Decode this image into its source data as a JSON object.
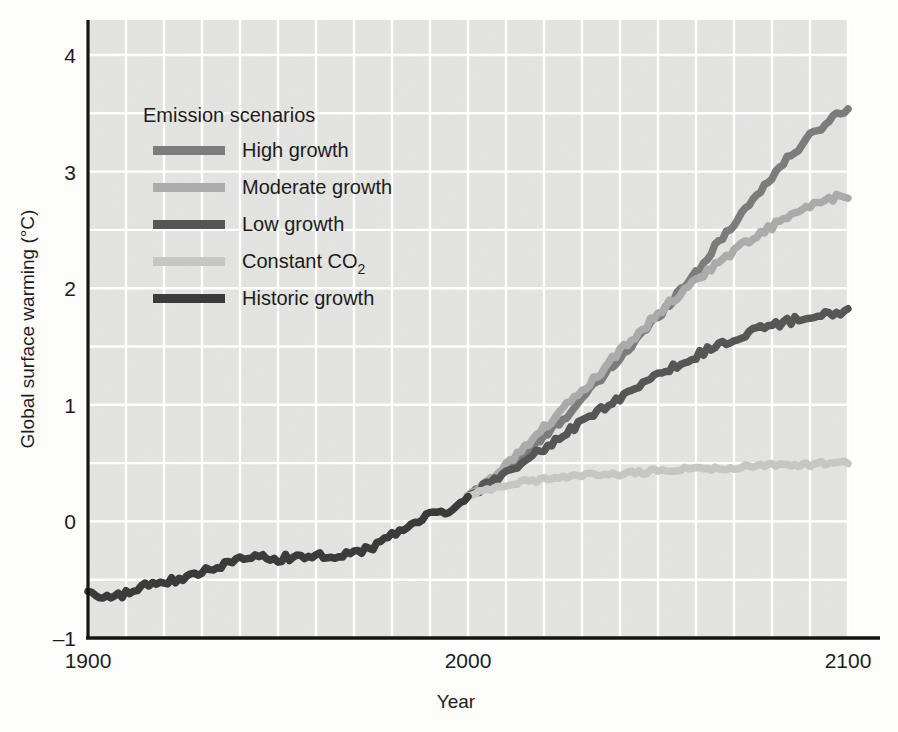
{
  "chart_data": {
    "type": "line",
    "title": "",
    "xlabel": "Year",
    "ylabel": "Global surface warming (°C)",
    "xlim": [
      1900,
      2100
    ],
    "ylim": [
      -1,
      4.3
    ],
    "xticks": [
      1900,
      2000,
      2100
    ],
    "xtick_labels": [
      "1900",
      "2000",
      "2100"
    ],
    "yticks": [
      -1,
      0,
      1,
      2,
      3,
      4
    ],
    "ytick_labels": [
      "–1",
      "0",
      "1",
      "2",
      "3",
      "4"
    ],
    "grid": true,
    "grid_color": "#ffffff",
    "grid_x_step": 10,
    "grid_y_step": 0.5,
    "plot_background": "#e8e8e6",
    "legend_position": "upper-left-inside",
    "legend_title": "Emission scenarios",
    "branch_year": 2000,
    "series": [
      {
        "name": "High growth",
        "color": "#7c7c7c",
        "start_year": 2000,
        "end_year": 2100,
        "end_value": 3.55,
        "x": [
          2000,
          2005,
          2010,
          2015,
          2020,
          2025,
          2030,
          2035,
          2040,
          2045,
          2050,
          2055,
          2060,
          2065,
          2070,
          2075,
          2080,
          2085,
          2090,
          2095,
          2100
        ],
        "values": [
          0.22,
          0.33,
          0.45,
          0.58,
          0.72,
          0.88,
          1.05,
          1.22,
          1.4,
          1.58,
          1.76,
          1.95,
          2.14,
          2.35,
          2.56,
          2.76,
          2.96,
          3.14,
          3.3,
          3.44,
          3.55
        ]
      },
      {
        "name": "Moderate growth",
        "color": "#ababab",
        "start_year": 2000,
        "end_year": 2100,
        "end_value": 2.8,
        "x": [
          2000,
          2005,
          2010,
          2015,
          2020,
          2025,
          2030,
          2035,
          2040,
          2045,
          2050,
          2055,
          2060,
          2065,
          2070,
          2075,
          2080,
          2085,
          2090,
          2095,
          2100
        ],
        "values": [
          0.22,
          0.35,
          0.49,
          0.64,
          0.8,
          0.96,
          1.12,
          1.29,
          1.46,
          1.62,
          1.78,
          1.93,
          2.07,
          2.2,
          2.32,
          2.43,
          2.53,
          2.62,
          2.7,
          2.76,
          2.8
        ]
      },
      {
        "name": "Low growth",
        "color": "#565656",
        "start_year": 2000,
        "end_year": 2100,
        "end_value": 1.8,
        "x": [
          2000,
          2005,
          2010,
          2015,
          2020,
          2025,
          2030,
          2035,
          2040,
          2045,
          2050,
          2055,
          2060,
          2065,
          2070,
          2075,
          2080,
          2085,
          2090,
          2095,
          2100
        ],
        "values": [
          0.22,
          0.31,
          0.41,
          0.52,
          0.63,
          0.74,
          0.85,
          0.96,
          1.06,
          1.16,
          1.25,
          1.34,
          1.42,
          1.5,
          1.57,
          1.63,
          1.68,
          1.72,
          1.76,
          1.78,
          1.8
        ]
      },
      {
        "name": "Constant CO₂",
        "color": "#c6c6c4",
        "start_year": 2000,
        "end_year": 2100,
        "end_value": 0.5,
        "x": [
          2000,
          2005,
          2010,
          2015,
          2020,
          2025,
          2030,
          2035,
          2040,
          2045,
          2050,
          2055,
          2060,
          2065,
          2070,
          2075,
          2080,
          2085,
          2090,
          2095,
          2100
        ],
        "values": [
          0.22,
          0.27,
          0.31,
          0.34,
          0.36,
          0.38,
          0.39,
          0.4,
          0.41,
          0.42,
          0.43,
          0.44,
          0.45,
          0.45,
          0.46,
          0.47,
          0.48,
          0.48,
          0.49,
          0.5,
          0.5
        ]
      },
      {
        "name": "Historic growth",
        "color": "#3b3b3b",
        "start_year": 1900,
        "end_year": 2000,
        "end_value": 0.22,
        "x": [
          1900,
          1905,
          1910,
          1915,
          1920,
          1925,
          1930,
          1935,
          1940,
          1945,
          1950,
          1955,
          1960,
          1965,
          1970,
          1975,
          1980,
          1985,
          1990,
          1995,
          2000
        ],
        "values": [
          -0.6,
          -0.66,
          -0.62,
          -0.55,
          -0.52,
          -0.5,
          -0.43,
          -0.38,
          -0.3,
          -0.28,
          -0.32,
          -0.3,
          -0.28,
          -0.3,
          -0.27,
          -0.22,
          -0.1,
          -0.04,
          0.06,
          0.1,
          0.22
        ]
      }
    ],
    "legend_entries": [
      {
        "label": "High growth",
        "color": "#7c7c7c"
      },
      {
        "label": "Moderate growth",
        "color": "#ababab"
      },
      {
        "label": "Low growth",
        "color": "#565656"
      },
      {
        "label": "Constant CO",
        "sub": "2",
        "color": "#c6c6c4"
      },
      {
        "label": "Historic growth",
        "color": "#3b3b3b"
      }
    ]
  }
}
